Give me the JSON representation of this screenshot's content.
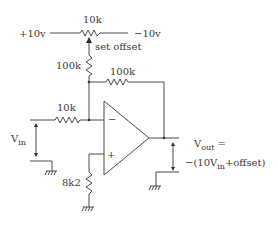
{
  "diagram": {
    "type": "op-amp offset inverting amplifier schematic",
    "supply_positive_label": "+10v",
    "supply_negative_label": "−10v",
    "pot": {
      "value_label": "10k",
      "wiper_label": "set offset"
    },
    "offset_resistor_label": "100k",
    "feedback_resistor_label": "100k",
    "input_resistor_label": "10k",
    "bias_resistor_label": "8k2",
    "opamp": {
      "inverting_label": "−",
      "noninverting_label": "+"
    },
    "input_label": {
      "main": "V",
      "sub": "in"
    },
    "output_label": {
      "line1_main": "V",
      "line1_sub": "out",
      "line1_tail": " =",
      "line2_prefix": "−(10V",
      "line2_sub": "in",
      "line2_tail": "+offset)"
    }
  }
}
